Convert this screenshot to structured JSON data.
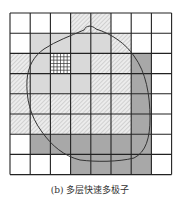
{
  "caption": "(b) 多层快速多极子",
  "grid": {
    "x0": 10,
    "y0": 13,
    "cell": 20.2,
    "rows": 8,
    "cols": 8,
    "legend_fills": {
      "white": "#ffffff",
      "light": "#d9d9d9",
      "hatch": "hatch",
      "dark": "#a6a6a6",
      "fine": "finegrid"
    },
    "cells": [
      [
        "white",
        "white",
        "white",
        "hatch",
        "hatch",
        "white",
        "white",
        "white"
      ],
      [
        "white",
        "light",
        "light",
        "light",
        "light",
        "hatch",
        "white",
        "white"
      ],
      [
        "hatch",
        "light",
        "fine",
        "light",
        "hatch",
        "hatch",
        "dark",
        "white"
      ],
      [
        "hatch",
        "light",
        "light",
        "light",
        "hatch",
        "hatch",
        "dark",
        "white"
      ],
      [
        "hatch",
        "hatch",
        "hatch",
        "hatch",
        "hatch",
        "hatch",
        "dark",
        "white"
      ],
      [
        "hatch",
        "hatch",
        "hatch",
        "hatch",
        "hatch",
        "hatch",
        "dark",
        "white"
      ],
      [
        "white",
        "dark",
        "dark",
        "dark",
        "dark",
        "dark",
        "dark",
        "white"
      ],
      [
        "white",
        "white",
        "white",
        "dark",
        "dark",
        "dark",
        "dark",
        "white"
      ]
    ],
    "fine_subdivisions": 6
  },
  "boundary_curve": "M84,30 C86,25 92,25 96,29 C112,34 126,44 134,56 C146,72 150,95 150,118 C150,138 146,152 134,158 C118,162 96,162 80,160 C64,156 52,146 42,132 C30,116 26,98 27,80 C28,66 34,56 44,49 C56,41 70,36 84,30 Z"
}
